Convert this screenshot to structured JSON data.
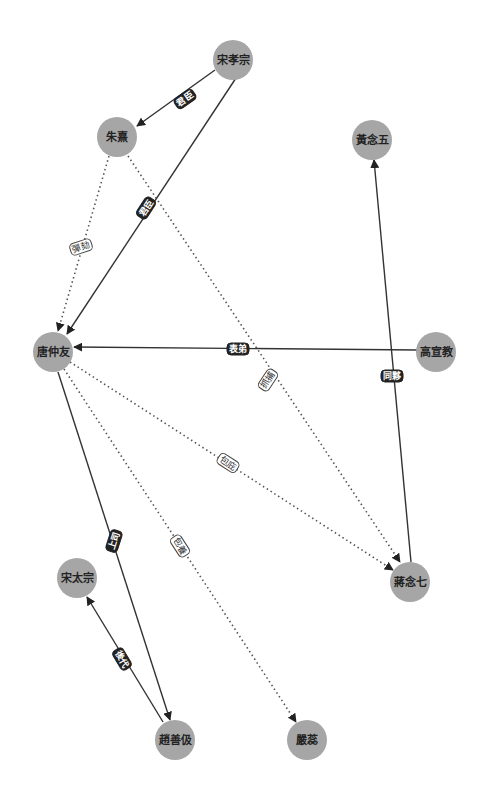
{
  "graph": {
    "type": "directed-relationship-graph",
    "colors": {
      "node_fill": "#a6a6a6",
      "solid_edge": "#333333",
      "dotted_edge": "#555555",
      "solid_label_bg": "#222222",
      "dotted_label_bg": "#ffffff"
    },
    "nodes": [
      {
        "id": "song_xiaozong",
        "label": "宋孝宗",
        "x": 233,
        "y": 60
      },
      {
        "id": "zhu_xi",
        "label": "朱熹",
        "x": 117,
        "y": 137
      },
      {
        "id": "huang_nianwu",
        "label": "黃念五",
        "x": 372,
        "y": 140
      },
      {
        "id": "tang_zhongyou",
        "label": "唐仲友",
        "x": 53,
        "y": 352
      },
      {
        "id": "gao_xuanjiao",
        "label": "高宣教",
        "x": 436,
        "y": 352
      },
      {
        "id": "jiang_nianqi",
        "label": "蔣念七",
        "x": 410,
        "y": 580
      },
      {
        "id": "song_taizong",
        "label": "宋太宗",
        "x": 77,
        "y": 578
      },
      {
        "id": "zhao_shanji",
        "label": "趙善伋",
        "x": 175,
        "y": 740
      },
      {
        "id": "yan_rui",
        "label": "嚴蕊",
        "x": 305,
        "y": 740
      }
    ],
    "edges": [
      {
        "from": "song_xiaozong",
        "to": "zhu_xi",
        "label": "君臣",
        "style": "solid"
      },
      {
        "from": "song_xiaozong",
        "to": "tang_zhongyou",
        "label": "君臣",
        "style": "solid"
      },
      {
        "from": "zhu_xi",
        "to": "tang_zhongyou",
        "label": "彈劾",
        "style": "dotted"
      },
      {
        "from": "zhu_xi",
        "to": "jiang_nianqi",
        "label": "抓捕",
        "style": "dotted"
      },
      {
        "from": "gao_xuanjiao",
        "to": "tang_zhongyou",
        "label": "表弟",
        "style": "solid"
      },
      {
        "from": "jiang_nianqi",
        "to": "huang_nianwu",
        "label": "同夥",
        "style": "solid"
      },
      {
        "from": "tang_zhongyou",
        "to": "jiang_nianqi",
        "label": "包庇",
        "style": "dotted"
      },
      {
        "from": "tang_zhongyou",
        "to": "yan_rui",
        "label": "包養",
        "style": "dotted"
      },
      {
        "from": "tang_zhongyou",
        "to": "zhao_shanji",
        "label": "上司",
        "style": "solid"
      },
      {
        "from": "zhao_shanji",
        "to": "song_taizong",
        "label": "後代",
        "style": "solid"
      }
    ]
  },
  "labels": {
    "node_song_xiaozong": "宋孝宗",
    "node_zhu_xi": "朱熹",
    "node_huang_nianwu": "黃念五",
    "node_tang_zhongyou": "唐仲友",
    "node_gao_xuanjiao": "高宣教",
    "node_jiang_nianqi": "蔣念七",
    "node_song_taizong": "宋太宗",
    "node_zhao_shanji": "趙善伋",
    "node_yan_rui": "嚴蕊",
    "edge_junchen_1": "君臣",
    "edge_junchen_2": "君臣",
    "edge_tanhe": "彈劾",
    "edge_zhuabu": "抓捕",
    "edge_biaodi": "表弟",
    "edge_tonghuo": "同夥",
    "edge_baobi": "包庇",
    "edge_baoyang": "包養",
    "edge_shangsi": "上司",
    "edge_houdai": "後代"
  }
}
